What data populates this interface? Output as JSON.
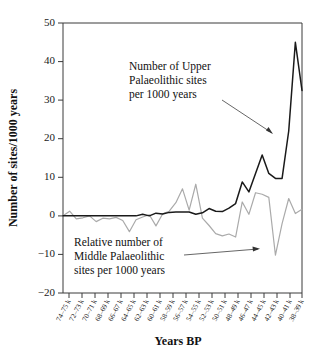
{
  "chart_data": {
    "type": "line",
    "title": "",
    "xlabel": "Years BP",
    "ylabel": "Number of sites/1000 years",
    "ylim": [
      -20,
      50
    ],
    "yticks": [
      50,
      40,
      30,
      20,
      10,
      0,
      -10,
      -20
    ],
    "ytick_labels": [
      "50",
      "40",
      "30",
      "20",
      "10",
      "0",
      "−10",
      "−20"
    ],
    "grid": false,
    "legend_position": "inline-annotations",
    "categories": [
      "74–75 k",
      "72–73 k",
      "70–71 k",
      "68–69 k",
      "66–67 k",
      "64–65 k",
      "62–63 k",
      "60–61 k",
      "58–59 k",
      "56–57 k",
      "54–55 k",
      "52–53 k",
      "50–51 k",
      "48–49 k",
      "46–47 k",
      "44–45 k",
      "42–43 k",
      "40–41 k",
      "38–39 k"
    ],
    "series": [
      {
        "name": "Number of Upper Palaeolithic sites per 1000 years",
        "color": "#1a1a1a",
        "x": [
          "74–75 k",
          "73 k",
          "72–73 k",
          "71 k",
          "70–71 k",
          "69 k",
          "68–69 k",
          "67 k",
          "66–67 k",
          "65 k",
          "64–65 k",
          "63 k",
          "62–63 k",
          "61 k",
          "60–61 k",
          "59 k",
          "58–59 k",
          "57 k",
          "56–57 k",
          "55 k",
          "54–55 k",
          "53 k",
          "52–53 k",
          "51 k",
          "50–51 k",
          "49 k",
          "48–49 k",
          "47 k",
          "46–47 k",
          "45 k",
          "44–45 k",
          "43 k",
          "42–43 k",
          "41 k",
          "40–41 k",
          "39 k",
          "38–39 k"
        ],
        "values": [
          0,
          0,
          0,
          0,
          0,
          0,
          0,
          0,
          0,
          0,
          0,
          0,
          0.4,
          0,
          0.7,
          0.5,
          0.9,
          1.0,
          1.0,
          1.0,
          0.4,
          0.8,
          1.9,
          1.2,
          1.1,
          2.0,
          3.2,
          8.8,
          6.2,
          11.0,
          15.8,
          11.0,
          9.7,
          9.7,
          22.0,
          45.0,
          32.5
        ]
      },
      {
        "name": "Relative number of Middle Palaeolithic sites per 1000 years",
        "color": "#aaaaaa",
        "x": [
          "74–75 k",
          "73 k",
          "72–73 k",
          "71 k",
          "70–71 k",
          "69 k",
          "68–69 k",
          "67 k",
          "66–67 k",
          "65 k",
          "64–65 k",
          "63 k",
          "62–63 k",
          "61 k",
          "60–61 k",
          "59 k",
          "58–59 k",
          "57 k",
          "56–57 k",
          "55 k",
          "54–55 k",
          "53 k",
          "52–53 k",
          "51 k",
          "50–51 k",
          "49 k",
          "48–49 k",
          "47 k",
          "46–47 k",
          "45 k",
          "44–45 k",
          "43 k",
          "42–43 k",
          "41 k",
          "40–41 k",
          "39 k",
          "38–39 k"
        ],
        "values": [
          0,
          1.2,
          -0.8,
          -0.5,
          0,
          -1.5,
          -0.6,
          -0.8,
          -0.4,
          -1.2,
          -4.1,
          -1.0,
          -0.3,
          0.3,
          -2.6,
          0.5,
          1.2,
          3.4,
          7.0,
          1.5,
          8.2,
          -0.6,
          -2.5,
          -4.6,
          -5.2,
          -4.7,
          -5.5,
          3.6,
          0.4,
          6.0,
          5.6,
          4.8,
          -10.2,
          -2.0,
          4.5,
          0.6,
          1.7
        ]
      }
    ],
    "annotations": [
      {
        "id": "upper-annotation",
        "lines": [
          "Number of Upper",
          "Palaeolithic sites",
          "per 1000 years"
        ],
        "points_to": "upper-series-rise"
      },
      {
        "id": "middle-annotation",
        "lines": [
          "Relative number of",
          "Middle Palaeolithic",
          "sites per 1000 years"
        ],
        "points_to": "middle-series-trough"
      }
    ]
  }
}
